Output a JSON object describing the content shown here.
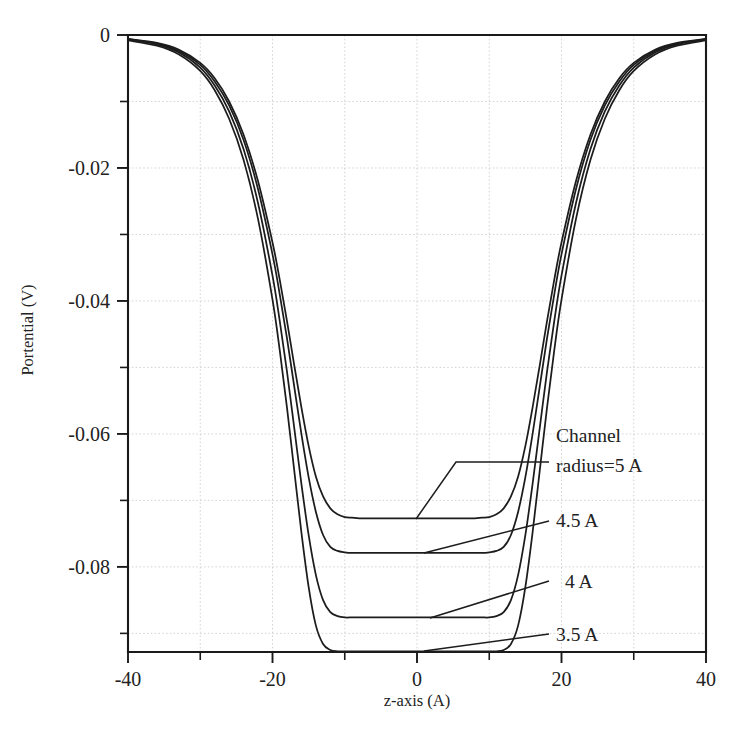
{
  "chart_data": {
    "type": "line",
    "title": "",
    "xlabel": "z-axis (A)",
    "ylabel": "Portential (V)",
    "xlim": [
      -40,
      40
    ],
    "ylim": [
      -0.0927,
      0
    ],
    "grid": true,
    "legend_position": "inline-annotations",
    "xticks": [
      -40,
      -20,
      0,
      20,
      40
    ],
    "xtick_labels": [
      "-40",
      "-20",
      "0",
      "20",
      "40"
    ],
    "xticks_minor": [
      -30,
      -10,
      10,
      30
    ],
    "yticks": [
      0,
      -0.02,
      -0.04,
      -0.06,
      -0.08
    ],
    "ytick_labels": [
      "0",
      "-0.02",
      "-0.04",
      "-0.06",
      "-0.08"
    ],
    "yticks_minor": [
      -0.01,
      -0.03,
      -0.05,
      -0.07,
      -0.09
    ],
    "annotations": [
      {
        "id": "a5",
        "text_line1": "Channel",
        "text_line2": "radius=5 A",
        "value": "5 A"
      },
      {
        "id": "a45",
        "text_line1": "4.5 A",
        "text_line2": "",
        "value": "4.5 A"
      },
      {
        "id": "a4",
        "text_line1": "4 A",
        "text_line2": "",
        "value": "4 A"
      },
      {
        "id": "a35",
        "text_line1": "3.5 A",
        "text_line2": "",
        "value": "3.5 A"
      }
    ],
    "series": [
      {
        "name": "Channel radius=5 A",
        "plateau": -0.0727,
        "x": [
          -40,
          -36,
          -33,
          -30,
          -28,
          -26,
          -24,
          -22,
          -20,
          -19,
          -18,
          -17,
          -16,
          -15,
          -14,
          -13,
          -12,
          -11,
          -10,
          -9,
          -8,
          -7,
          -6,
          -5,
          -4,
          -3,
          -2,
          -1,
          0,
          1,
          2,
          3,
          4,
          5,
          6,
          7,
          8,
          9,
          10,
          11,
          12,
          13,
          14,
          15,
          16,
          17,
          18,
          19,
          20,
          22,
          24,
          26,
          28,
          30,
          33,
          36,
          40
        ],
        "y": [
          -0.0006,
          -0.0012,
          -0.0022,
          -0.0042,
          -0.0065,
          -0.01,
          -0.015,
          -0.022,
          -0.0312,
          -0.0368,
          -0.043,
          -0.0496,
          -0.056,
          -0.0618,
          -0.0664,
          -0.0694,
          -0.0712,
          -0.0721,
          -0.0725,
          -0.0726,
          -0.0727,
          -0.0727,
          -0.0727,
          -0.0727,
          -0.0727,
          -0.0727,
          -0.0727,
          -0.0727,
          -0.0727,
          -0.0727,
          -0.0727,
          -0.0727,
          -0.0727,
          -0.0727,
          -0.0727,
          -0.0727,
          -0.0727,
          -0.0726,
          -0.0725,
          -0.0721,
          -0.0712,
          -0.0694,
          -0.0664,
          -0.0618,
          -0.056,
          -0.0496,
          -0.043,
          -0.0368,
          -0.0312,
          -0.022,
          -0.015,
          -0.01,
          -0.0065,
          -0.0042,
          -0.0022,
          -0.0012,
          -0.0006
        ]
      },
      {
        "name": "4.5 A",
        "plateau": -0.0779,
        "x": [
          -40,
          -36,
          -33,
          -30,
          -28,
          -26,
          -24,
          -22,
          -20,
          -19,
          -18,
          -17,
          -16,
          -15,
          -14,
          -13,
          -12,
          -11,
          -10,
          -9,
          -8,
          -7,
          -6,
          -5,
          -4,
          -3,
          -2,
          -1,
          0,
          1,
          2,
          3,
          4,
          5,
          6,
          7,
          8,
          9,
          10,
          11,
          12,
          13,
          14,
          15,
          16,
          17,
          18,
          19,
          20,
          22,
          24,
          26,
          28,
          30,
          33,
          36,
          40
        ],
        "y": [
          -0.0006,
          -0.0013,
          -0.0024,
          -0.0045,
          -0.007,
          -0.0106,
          -0.0158,
          -0.0232,
          -0.033,
          -0.039,
          -0.0456,
          -0.0528,
          -0.06,
          -0.0665,
          -0.0717,
          -0.0752,
          -0.077,
          -0.0776,
          -0.0778,
          -0.0779,
          -0.0779,
          -0.0779,
          -0.0779,
          -0.0779,
          -0.0779,
          -0.0779,
          -0.0779,
          -0.0779,
          -0.0779,
          -0.0779,
          -0.0779,
          -0.0779,
          -0.0779,
          -0.0779,
          -0.0779,
          -0.0779,
          -0.0779,
          -0.0779,
          -0.0778,
          -0.0776,
          -0.077,
          -0.0752,
          -0.0717,
          -0.0665,
          -0.06,
          -0.0528,
          -0.0456,
          -0.039,
          -0.033,
          -0.0232,
          -0.0158,
          -0.0106,
          -0.007,
          -0.0045,
          -0.0024,
          -0.0013,
          -0.0006
        ]
      },
      {
        "name": "4 A",
        "plateau": -0.0876,
        "x": [
          -40,
          -36,
          -33,
          -30,
          -28,
          -26,
          -24,
          -22,
          -20,
          -19,
          -18,
          -17,
          -16,
          -15,
          -14,
          -13,
          -12,
          -11,
          -10,
          -9,
          -8,
          -7,
          -6,
          -5,
          -4,
          -3,
          -2,
          -1,
          0,
          1,
          2,
          3,
          4,
          5,
          6,
          7,
          8,
          9,
          10,
          11,
          12,
          13,
          14,
          15,
          16,
          17,
          18,
          19,
          20,
          22,
          24,
          26,
          28,
          30,
          33,
          36,
          40
        ],
        "y": [
          -0.0007,
          -0.0014,
          -0.0026,
          -0.0049,
          -0.0076,
          -0.0115,
          -0.0172,
          -0.0253,
          -0.0362,
          -0.043,
          -0.0506,
          -0.059,
          -0.0675,
          -0.0752,
          -0.0812,
          -0.085,
          -0.0868,
          -0.0874,
          -0.0876,
          -0.0876,
          -0.0876,
          -0.0876,
          -0.0876,
          -0.0876,
          -0.0876,
          -0.0876,
          -0.0876,
          -0.0876,
          -0.0876,
          -0.0876,
          -0.0876,
          -0.0876,
          -0.0876,
          -0.0876,
          -0.0876,
          -0.0876,
          -0.0876,
          -0.0876,
          -0.0876,
          -0.0874,
          -0.0868,
          -0.085,
          -0.0812,
          -0.0752,
          -0.0675,
          -0.059,
          -0.0506,
          -0.043,
          -0.0362,
          -0.0253,
          -0.0172,
          -0.0115,
          -0.0076,
          -0.0049,
          -0.0026,
          -0.0014,
          -0.0007
        ]
      },
      {
        "name": "3.5 A",
        "plateau": -0.0927,
        "x": [
          -40,
          -36,
          -33,
          -30,
          -28,
          -26,
          -24,
          -22,
          -20,
          -19,
          -18,
          -17,
          -16,
          -15,
          -14,
          -13,
          -12,
          -11,
          -10,
          -9,
          -8,
          -7,
          -6,
          -5,
          -4,
          -3,
          -2,
          -1,
          0,
          1,
          2,
          3,
          4,
          5,
          6,
          7,
          8,
          9,
          10,
          11,
          12,
          13,
          14,
          15,
          16,
          17,
          18,
          19,
          20,
          22,
          24,
          26,
          28,
          30,
          33,
          36,
          40
        ],
        "y": [
          -0.0008,
          -0.0016,
          -0.0029,
          -0.0054,
          -0.0083,
          -0.0126,
          -0.0188,
          -0.0277,
          -0.0398,
          -0.0474,
          -0.056,
          -0.0654,
          -0.0748,
          -0.083,
          -0.0888,
          -0.0916,
          -0.0925,
          -0.0927,
          -0.0927,
          -0.0927,
          -0.0927,
          -0.0927,
          -0.0927,
          -0.0927,
          -0.0927,
          -0.0927,
          -0.0927,
          -0.0927,
          -0.0927,
          -0.0927,
          -0.0927,
          -0.0927,
          -0.0927,
          -0.0927,
          -0.0927,
          -0.0927,
          -0.0927,
          -0.0927,
          -0.0927,
          -0.0927,
          -0.0925,
          -0.0916,
          -0.0888,
          -0.083,
          -0.0748,
          -0.0654,
          -0.056,
          -0.0474,
          -0.0398,
          -0.0277,
          -0.0188,
          -0.0126,
          -0.0083,
          -0.0054,
          -0.0029,
          -0.0016,
          -0.0008
        ]
      }
    ]
  }
}
